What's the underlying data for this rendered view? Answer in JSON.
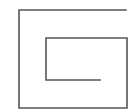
{
  "diagram": {
    "type": "rectangular-spiral",
    "stroke_color": "#555555",
    "stroke_width": 1.6,
    "background": "#ffffff",
    "points": "126,10 19,10 19,108 127,108 127,38 46,38 46,80 100,80"
  }
}
